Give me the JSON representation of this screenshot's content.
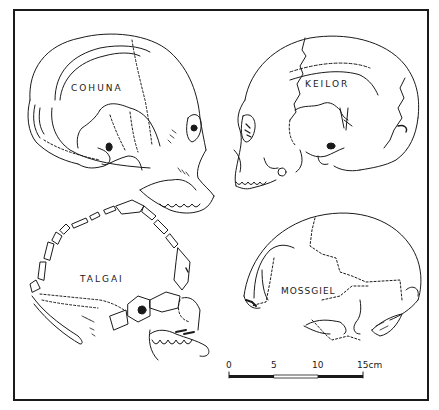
{
  "figure": {
    "line_color": "#1a1a1a",
    "background": "#ffffff"
  },
  "skulls": [
    {
      "name": "COHUNA",
      "position": "top-left",
      "facing": "right"
    },
    {
      "name": "KEILOR",
      "position": "top-right",
      "facing": "left"
    },
    {
      "name": "TALGAI",
      "position": "bottom-left",
      "facing": "right"
    },
    {
      "name": "MOSSGIEL",
      "position": "bottom-right",
      "facing": "left"
    }
  ],
  "scale_bar": {
    "ticks": [
      "0",
      "5",
      "10",
      "15"
    ],
    "unit": "cm",
    "last_label": "15cm",
    "segments": [
      "filled",
      "open",
      "filled"
    ]
  }
}
